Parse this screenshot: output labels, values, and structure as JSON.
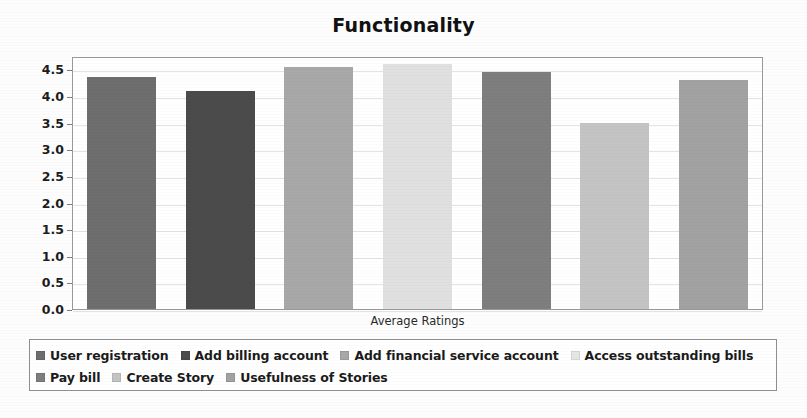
{
  "chart_data": {
    "type": "bar",
    "title": "Functionality",
    "xlabel": "Average Ratings",
    "ylabel": "",
    "ylim": [
      0.0,
      4.75
    ],
    "ytick_labels": [
      "0.0",
      "0.5",
      "1.0",
      "1.5",
      "2.0",
      "2.5",
      "3.0",
      "3.5",
      "4.0",
      "4.5"
    ],
    "ytick_values": [
      0.0,
      0.5,
      1.0,
      1.5,
      2.0,
      2.5,
      3.0,
      3.5,
      4.0,
      4.5
    ],
    "grid": true,
    "legend_position": "bottom",
    "categories": [
      "User registration",
      "Add billing account",
      "Add financial service account",
      "Access outstanding bills",
      "Pay bill",
      "Create Story",
      "Usefulness of Stories"
    ],
    "values": [
      4.35,
      4.1,
      4.55,
      4.6,
      4.45,
      3.5,
      4.3
    ],
    "colors": [
      "#6e6e6e",
      "#4b4b4b",
      "#a8a8a8",
      "#e0e0e0",
      "#7e7e7e",
      "#c4c4c4",
      "#a2a2a2"
    ],
    "series": [
      {
        "name": "Average Ratings",
        "values": [
          4.35,
          4.1,
          4.55,
          4.6,
          4.45,
          3.5,
          4.3
        ]
      }
    ]
  },
  "legend": {
    "rows": [
      [
        {
          "label": "User registration",
          "color": "#6e6e6e"
        },
        {
          "label": "Add billing account",
          "color": "#4b4b4b"
        },
        {
          "label": "Add financial service account",
          "color": "#a8a8a8"
        },
        {
          "label": "Access outstanding bills",
          "color": "#e6e6e6"
        }
      ],
      [
        {
          "label": "Pay bill",
          "color": "#7e7e7e"
        },
        {
          "label": "Create Story",
          "color": "#c4c4c4"
        },
        {
          "label": "Usefulness of Stories",
          "color": "#a2a2a2"
        }
      ]
    ]
  }
}
